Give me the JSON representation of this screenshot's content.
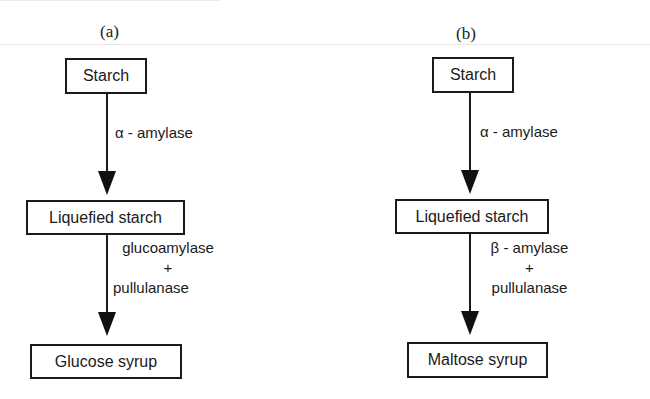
{
  "panels": [
    {
      "label": "(a)",
      "steps": [
        "Starch",
        "Liquefied starch",
        "Glucose syrup"
      ],
      "enzymes": [
        {
          "lines": [
            "α - amylase"
          ]
        },
        {
          "lines": [
            "glucoamylase",
            "+",
            "pullulanase"
          ]
        }
      ]
    },
    {
      "label": "(b)",
      "steps": [
        "Starch",
        "Liquefied starch",
        "Maltose syrup"
      ],
      "enzymes": [
        {
          "lines": [
            "α - amylase"
          ]
        },
        {
          "lines": [
            "β - amylase",
            "+",
            "pullulanase"
          ]
        }
      ]
    }
  ],
  "colors": {
    "line": "#1a1a1a",
    "background": "#ffffff"
  }
}
